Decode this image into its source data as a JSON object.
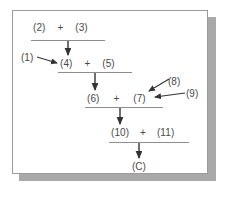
{
  "figure": {
    "panel": {
      "background_color": "#ffffff",
      "border_color": "#9b9b9b",
      "shadow_color": "#a9a9a9"
    },
    "text_color": "#4a4a4a",
    "rule_color": "#8d8d8d",
    "arrow_color": "#333333"
  },
  "equations": [
    {
      "id": "row-1",
      "left": "(2)",
      "operator": "+",
      "right": "(3)",
      "product": "(4)"
    },
    {
      "id": "row-2",
      "left": "(4)",
      "operator": "+",
      "right": "(5)",
      "product": "(6)"
    },
    {
      "id": "row-3",
      "left": "(6)",
      "operator": "+",
      "right": "(7)",
      "product": "(10)"
    },
    {
      "id": "row-4",
      "left": "(10)",
      "operator": "+",
      "right": "(11)",
      "product": "(C)"
    }
  ],
  "final_product": "(C)",
  "callouts": [
    {
      "id": "callout-1",
      "label": "(1)",
      "points_to": "(4)"
    },
    {
      "id": "callout-8",
      "label": "(8)",
      "points_to": "(7)"
    },
    {
      "id": "callout-9",
      "label": "(9)",
      "points_to": "(7)"
    }
  ]
}
